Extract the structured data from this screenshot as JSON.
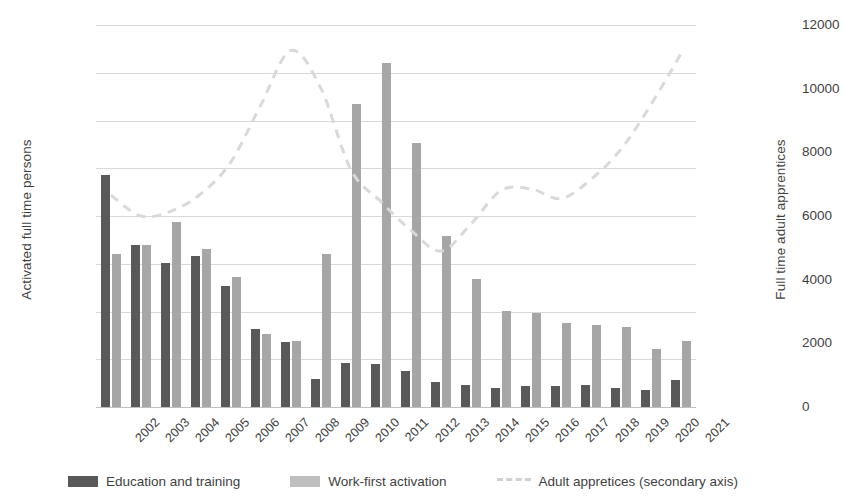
{
  "chart_data": {
    "type": "bar",
    "title": "",
    "xlabel": "",
    "ylabel": "Activated full time persons",
    "ylabel_secondary": "Full time adult apprentices",
    "categories": [
      "2002",
      "2003",
      "2004",
      "2005",
      "2006",
      "2007",
      "2008",
      "2009",
      "2010",
      "2011",
      "2012",
      "2013",
      "2014",
      "2015",
      "2016",
      "2017",
      "2018",
      "2019",
      "2020",
      "2021"
    ],
    "ylim": [
      0,
      40000
    ],
    "yticks": [
      0,
      5000,
      10000,
      15000,
      20000,
      25000,
      30000,
      35000,
      40000
    ],
    "ylim_secondary": [
      0,
      12000
    ],
    "yticks_secondary": [
      0,
      2000,
      4000,
      6000,
      8000,
      10000,
      12000
    ],
    "grid": true,
    "legend_position": "bottom",
    "series": [
      {
        "name": "Education and training",
        "type": "bar",
        "axis": "primary",
        "color": "#595959",
        "values": [
          24300,
          17000,
          15100,
          15800,
          12700,
          8200,
          6800,
          2900,
          4600,
          4500,
          3800,
          2650,
          2300,
          1950,
          2250,
          2150,
          2300,
          2000,
          1750,
          2800
        ]
      },
      {
        "name": "Work-first activation",
        "type": "bar",
        "axis": "primary",
        "color": "#a6a6a6",
        "values": [
          16000,
          17000,
          19400,
          16500,
          13600,
          7600,
          6900,
          16000,
          31700,
          36000,
          27600,
          17900,
          13400,
          10100,
          9800,
          8800,
          8550,
          8350,
          6100,
          6900
        ]
      },
      {
        "name": "Adult appretices (secondary axis)",
        "type": "line",
        "axis": "secondary",
        "style": "dashed",
        "color": "#d9d9d9",
        "values": [
          6650,
          6000,
          6150,
          6700,
          7700,
          9500,
          11200,
          10000,
          7450,
          6450,
          5550,
          4900,
          5750,
          6800,
          6850,
          6550,
          7150,
          8100,
          9500,
          11100
        ]
      }
    ]
  },
  "axes": {
    "left_title": "Activated full time persons",
    "right_title": "Full time adult apprentices",
    "left_ticks": [
      "40000",
      "35000",
      "30000",
      "25000",
      "20000",
      "15000",
      "10000",
      "5000",
      "0"
    ],
    "right_ticks": [
      "12000",
      "10000",
      "8000",
      "6000",
      "4000",
      "2000",
      "0"
    ]
  },
  "legend": {
    "items": [
      {
        "label": "Education and training",
        "marker": "bar-swatch-dark"
      },
      {
        "label": "Work-first activation",
        "marker": "bar-swatch-light"
      },
      {
        "label": "Adult appretices (secondary axis)",
        "marker": "dashed-line"
      }
    ]
  }
}
